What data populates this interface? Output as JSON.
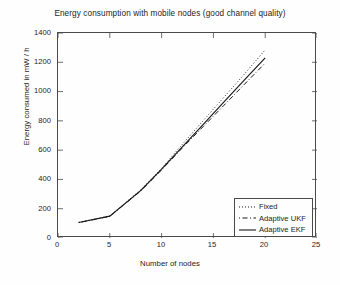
{
  "chart_data": {
    "type": "line",
    "title": "Energy consumption with mobile nodes (good channel quality)",
    "xlabel": "Number of nodes",
    "ylabel": "Energy consumed in mW / h",
    "xlim": [
      0,
      25
    ],
    "ylim": [
      0,
      1400
    ],
    "xticks": [
      0,
      5,
      10,
      15,
      20,
      25
    ],
    "yticks": [
      0,
      200,
      400,
      600,
      800,
      1000,
      1200,
      1400
    ],
    "grid": false,
    "legend_position": "lower right",
    "x": [
      2,
      5,
      8,
      10,
      12,
      14,
      16,
      18,
      20
    ],
    "series": [
      {
        "name": "Fixed",
        "style": "dotted",
        "color": "#1a1a1a",
        "values": [
          107,
          150,
          330,
          475,
          640,
          800,
          960,
          1120,
          1285
        ]
      },
      {
        "name": "Adaptive UKF",
        "style": "dash-dot",
        "color": "#1a1a1a",
        "values": [
          105,
          148,
          322,
          465,
          615,
          760,
          905,
          1050,
          1195
        ]
      },
      {
        "name": "Adaptive EKF",
        "style": "solid",
        "color": "#1a1a1a",
        "values": [
          106,
          149,
          325,
          470,
          622,
          775,
          928,
          1080,
          1230
        ]
      }
    ]
  },
  "axis": {
    "y_tick_labels": [
      "1400",
      "1200",
      "1000",
      "800",
      "600",
      "400",
      "200",
      "0"
    ],
    "x_tick_labels": [
      "0",
      "5",
      "10",
      "15",
      "20",
      "25"
    ]
  },
  "legend": {
    "items": [
      {
        "label": "Fixed"
      },
      {
        "label": "Adaptive UKF"
      },
      {
        "label": "Adaptive EKF"
      }
    ]
  }
}
